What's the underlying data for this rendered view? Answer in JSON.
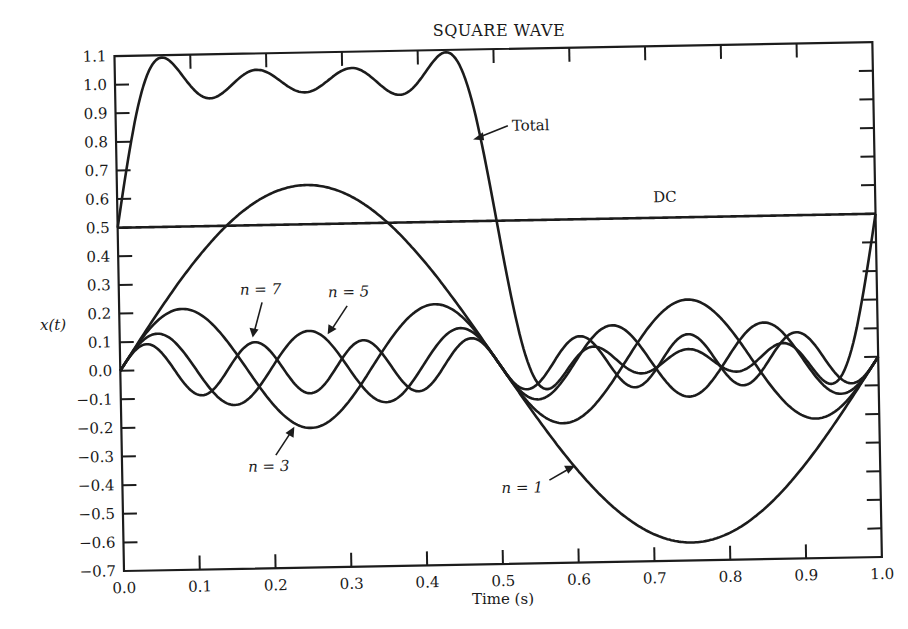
{
  "chart_data": {
    "type": "line",
    "title": "SQUARE WAVE",
    "xlabel": "Time (s)",
    "ylabel": "x(t)",
    "xlim": [
      0.0,
      1.0
    ],
    "ylim": [
      -0.7,
      1.1
    ],
    "grid": false,
    "legend": "none (curves annotated inline with arrows)",
    "x_ticks": [
      "0.0",
      "0.1",
      "0.2",
      "0.3",
      "0.4",
      "0.5",
      "0.6",
      "0.7",
      "0.8",
      "0.9",
      "1.0"
    ],
    "y_ticks": [
      "1.1",
      "1.0",
      "0.9",
      "0.8",
      "0.7",
      "0.6",
      "0.5",
      "0.4",
      "0.3",
      "0.2",
      "0.1",
      "0.0",
      "-0.1",
      "-0.2",
      "-0.3",
      "-0.4",
      "-0.5",
      "-0.6",
      "-0.7"
    ],
    "x": [
      0.0,
      0.05,
      0.1,
      0.15,
      0.2,
      0.25,
      0.3,
      0.35,
      0.4,
      0.45,
      0.5,
      0.55,
      0.6,
      0.65,
      0.7,
      0.75,
      0.8,
      0.85,
      0.9,
      0.95,
      1.0
    ],
    "series": [
      {
        "name": "DC",
        "label": "DC",
        "dc": 0.5,
        "values": [
          0.5,
          0.5,
          0.5,
          0.5,
          0.5,
          0.5,
          0.5,
          0.5,
          0.5,
          0.5,
          0.5,
          0.5,
          0.5,
          0.5,
          0.5,
          0.5,
          0.5,
          0.5,
          0.5,
          0.5,
          0.5
        ]
      },
      {
        "name": "n = 1",
        "label": "n = 1",
        "harmonic": 1,
        "amplitude": 0.637,
        "values": [
          0.0,
          0.197,
          0.374,
          0.515,
          0.606,
          0.637,
          0.606,
          0.515,
          0.374,
          0.197,
          0.0,
          -0.197,
          -0.374,
          -0.515,
          -0.606,
          -0.637,
          -0.606,
          -0.515,
          -0.374,
          -0.197,
          0.0
        ]
      },
      {
        "name": "n = 3",
        "label": "n = 3",
        "harmonic": 3,
        "amplitude": 0.212,
        "values": [
          0.0,
          0.172,
          0.202,
          0.066,
          -0.125,
          -0.212,
          -0.125,
          0.066,
          0.202,
          0.172,
          0.0,
          -0.172,
          -0.202,
          -0.066,
          0.125,
          0.212,
          0.125,
          -0.066,
          -0.202,
          -0.172,
          0.0
        ]
      },
      {
        "name": "n = 5",
        "label": "n = 5",
        "harmonic": 5,
        "amplitude": 0.127,
        "values": [
          0.0,
          0.127,
          0.0,
          -0.127,
          0.0,
          0.127,
          0.0,
          -0.127,
          0.0,
          0.127,
          0.0,
          -0.127,
          0.0,
          0.127,
          0.0,
          -0.127,
          0.0,
          0.127,
          0.0,
          -0.127,
          0.0
        ]
      },
      {
        "name": "n = 7",
        "label": "n = 7",
        "harmonic": 7,
        "amplitude": 0.091,
        "values": [
          0.0,
          0.081,
          -0.053,
          -0.028,
          0.087,
          -0.091,
          0.087,
          -0.028,
          -0.053,
          0.081,
          0.0,
          -0.081,
          0.053,
          0.028,
          -0.087,
          0.091,
          -0.087,
          0.028,
          0.053,
          -0.081,
          0.0
        ]
      },
      {
        "name": "Total",
        "label": "Total",
        "values": [
          0.5,
          0.977,
          1.023,
          0.926,
          1.068,
          0.971,
          1.068,
          0.926,
          1.023,
          1.077,
          0.5,
          -0.077,
          -0.023,
          0.074,
          -0.068,
          0.029,
          -0.068,
          0.074,
          -0.023,
          0.023,
          0.5
        ]
      }
    ],
    "annotations": [
      {
        "text": "Total",
        "points_to": "Total curve near t=0.48, x≈0.8"
      },
      {
        "text": "DC",
        "points_to": "DC line at 0.5 near t=0.75"
      },
      {
        "text": "n = 7",
        "points_to": "n=7 peak near t=0.18"
      },
      {
        "text": "n = 5",
        "points_to": "n=5 curve near t=0.28"
      },
      {
        "text": "n = 3",
        "points_to": "n=3 trough near t=0.25"
      },
      {
        "text": "n = 1",
        "points_to": "n=1 curve near t=0.62"
      }
    ]
  },
  "labels": {
    "title": "SQUARE WAVE",
    "xlabel": "Time (s)",
    "ylabel": "x(t)",
    "total": "Total",
    "dc": "DC",
    "n7": "n = 7",
    "n5": "n = 5",
    "n3": "n = 3",
    "n1": "n = 1"
  }
}
